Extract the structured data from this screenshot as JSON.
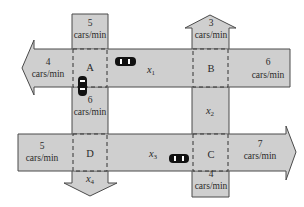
{
  "diagram": {
    "type": "traffic-flow-network",
    "intersections": [
      {
        "id": "A",
        "label": "A"
      },
      {
        "id": "B",
        "label": "B"
      },
      {
        "id": "C",
        "label": "C"
      },
      {
        "id": "D",
        "label": "D"
      }
    ],
    "flows": {
      "into_A_top": {
        "value": "5",
        "unit": "cars/min"
      },
      "out_A_left": {
        "value": "4",
        "unit": "cars/min"
      },
      "out_B_top": {
        "value": "3",
        "unit": "cars/min"
      },
      "into_B_right": {
        "value": "6",
        "unit": "cars/min"
      },
      "into_D_left": {
        "value": "5",
        "unit": "cars/min"
      },
      "out_C_right": {
        "value": "7",
        "unit": "cars/min"
      },
      "into_C_bottom": {
        "value": "4",
        "unit": "cars/min"
      },
      "A_to_D_label": {
        "value": "6",
        "unit": "cars/min"
      }
    },
    "unknowns": [
      {
        "name": "x",
        "sub": "1",
        "between": "A-B"
      },
      {
        "name": "x",
        "sub": "2",
        "between": "B-C"
      },
      {
        "name": "x",
        "sub": "3",
        "between": "C-D"
      },
      {
        "name": "x",
        "sub": "4",
        "between": "D-out"
      }
    ],
    "colors": {
      "road": "#cfcfcf",
      "outline": "#4a4a4a",
      "car": "#111111"
    }
  }
}
